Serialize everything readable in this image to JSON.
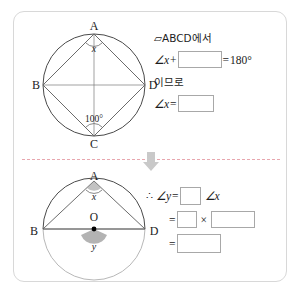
{
  "worksheet": {
    "divider_color": "#e8a6ae",
    "arrow_icon": "arrow-down-icon",
    "border_color": "#d8d8d8"
  },
  "top_section": {
    "figure": {
      "name": "cyclic-quadrilateral-abcd",
      "circle_label": "",
      "vertices": [
        {
          "id": "A",
          "label": "A",
          "x": 66,
          "y": 16
        },
        {
          "id": "B",
          "label": "B",
          "x": 12,
          "y": 66
        },
        {
          "id": "C",
          "label": "C",
          "x": 66,
          "y": 118
        },
        {
          "id": "D",
          "label": "D",
          "x": 120,
          "y": 66
        }
      ],
      "angle_x_label": "x",
      "angle_c_label": "100°",
      "angle_c_value": 100
    },
    "work": {
      "statement": "▱ABCD에서",
      "quad_symbol": "□",
      "quad_name": "ABCD",
      "statement_suffix": "에서",
      "eq1_lhs": "∠x",
      "eq1_plus": "+",
      "eq1_equals": "=",
      "eq1_rhs": "180°",
      "connector": "이므로",
      "eq2_lhs": "∠x",
      "eq2_equals": "="
    }
  },
  "bottom_section": {
    "figure": {
      "name": "inscribed-angle-circle-center-o",
      "vertices": [
        {
          "id": "A",
          "label": "A",
          "x": 66,
          "y": 12
        },
        {
          "id": "B",
          "label": "B",
          "x": 8,
          "y": 70
        },
        {
          "id": "O",
          "label": "O",
          "x": 66,
          "y": 56
        },
        {
          "id": "D",
          "label": "D",
          "x": 122,
          "y": 70
        }
      ],
      "angle_x_label": "x",
      "angle_y_label": "y",
      "center_label": "O"
    },
    "work": {
      "therefore": "∴",
      "eq1_lhs": "∠y",
      "eq1_equals": "=",
      "eq1_tail": "∠x",
      "eq2_equals": "=",
      "eq2_times": "×",
      "eq3_equals": "="
    }
  }
}
